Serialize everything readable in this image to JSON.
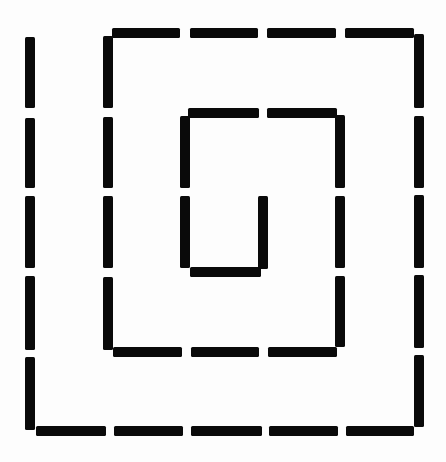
{
  "diagram": {
    "title": "",
    "stroke_color": "#0a0a0a",
    "background_color": "#fdfdfd",
    "stroke_width": 10,
    "segments": [
      {
        "name": "outer-left",
        "x1": 30,
        "y1": 37,
        "x2": 30,
        "y2": 430,
        "dashes": [
          [
            37,
            108
          ],
          [
            118,
            188
          ],
          [
            196,
            268
          ],
          [
            276,
            350
          ],
          [
            357,
            430
          ]
        ]
      },
      {
        "name": "outer-bottom",
        "x1": 36,
        "y1": 431,
        "x2": 414,
        "y2": 431,
        "dashes": [
          [
            36,
            106
          ],
          [
            114,
            183
          ],
          [
            191,
            262
          ],
          [
            269,
            338
          ],
          [
            346,
            414
          ]
        ]
      },
      {
        "name": "outer-right",
        "x1": 419,
        "y1": 34,
        "x2": 419,
        "y2": 427,
        "dashes": [
          [
            34,
            108
          ],
          [
            116,
            188
          ],
          [
            195,
            268
          ],
          [
            275,
            348
          ],
          [
            355,
            427
          ]
        ]
      },
      {
        "name": "middle-top",
        "x1": 112,
        "y1": 33,
        "x2": 414,
        "y2": 33,
        "dashes": [
          [
            112,
            180
          ],
          [
            190,
            258
          ],
          [
            267,
            336
          ],
          [
            345,
            414
          ]
        ]
      },
      {
        "name": "middle-left",
        "x1": 108,
        "y1": 36,
        "x2": 108,
        "y2": 350,
        "dashes": [
          [
            36,
            108
          ],
          [
            117,
            188
          ],
          [
            196,
            268
          ],
          [
            277,
            350
          ]
        ]
      },
      {
        "name": "middle-bottom",
        "x1": 113,
        "y1": 352,
        "x2": 337,
        "y2": 352,
        "dashes": [
          [
            113,
            182
          ],
          [
            191,
            259
          ],
          [
            268,
            337
          ]
        ]
      },
      {
        "name": "middle-right",
        "x1": 340,
        "y1": 115,
        "x2": 340,
        "y2": 347,
        "dashes": [
          [
            115,
            188
          ],
          [
            196,
            268
          ],
          [
            276,
            347
          ]
        ]
      },
      {
        "name": "inner-top",
        "x1": 188,
        "y1": 113,
        "x2": 337,
        "y2": 113,
        "dashes": [
          [
            188,
            259
          ],
          [
            267,
            337
          ]
        ]
      },
      {
        "name": "inner-left",
        "x1": 185,
        "y1": 116,
        "x2": 185,
        "y2": 268,
        "dashes": [
          [
            116,
            188
          ],
          [
            196,
            268
          ]
        ]
      },
      {
        "name": "inner-bottom",
        "x1": 190,
        "y1": 272,
        "x2": 261,
        "y2": 272,
        "dashes": [
          [
            190,
            261
          ]
        ]
      },
      {
        "name": "inner-right",
        "x1": 263,
        "y1": 196,
        "x2": 263,
        "y2": 269,
        "dashes": [
          [
            196,
            269
          ]
        ]
      }
    ]
  }
}
